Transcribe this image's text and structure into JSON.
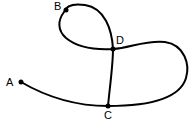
{
  "diagram": {
    "type": "curve-path",
    "stroke_color": "#000000",
    "background": "#ffffff",
    "points": [
      {
        "id": "A",
        "label": "A",
        "x": 21,
        "y": 82,
        "label_x": 6,
        "label_y": 86
      },
      {
        "id": "B",
        "label": "B",
        "x": 66,
        "y": 10,
        "label_x": 54,
        "label_y": 10
      },
      {
        "id": "C",
        "label": "C",
        "x": 108,
        "y": 106,
        "label_x": 104,
        "label_y": 119
      },
      {
        "id": "D",
        "label": "D",
        "x": 113,
        "y": 49,
        "label_x": 116,
        "label_y": 44
      }
    ],
    "segments": [
      {
        "from": "A",
        "to": "C",
        "description": "curve from A down to C"
      },
      {
        "from": "C",
        "to": "D",
        "description": "vertical line from C up to D"
      },
      {
        "from": "D",
        "to": "B",
        "description": "upper loop through B"
      },
      {
        "from": "D",
        "to": "C",
        "description": "right lobe loop back to C"
      }
    ]
  }
}
